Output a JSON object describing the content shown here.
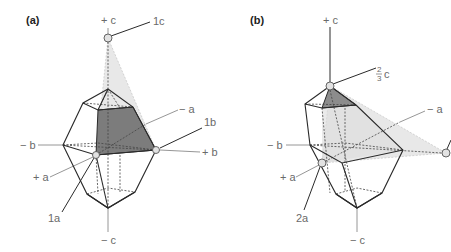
{
  "figure": {
    "panels": [
      {
        "id": "a",
        "label": "(a)",
        "axes": {
          "plus_c": "+ c",
          "minus_c": "− c",
          "plus_a": "+ a",
          "minus_a": "− a",
          "plus_b": "+ b",
          "minus_b": "− b"
        },
        "intercepts": {
          "a": "1a",
          "b": "1b",
          "c": "1c"
        },
        "plane_fill": "#e6e6e6",
        "face_fill": "#7a7a7a"
      },
      {
        "id": "b",
        "label": "(b)",
        "axes": {
          "plus_c": "+ c",
          "minus_c": "− c",
          "plus_a": "+ a",
          "minus_a": "− a",
          "minus_b": "− b"
        },
        "intercepts": {
          "a": "2a",
          "c_num": "2",
          "c_den": "3",
          "c_sym": "c"
        },
        "plane_fill": "#e6e6e6",
        "face_fill": "#8a8a8a"
      }
    ]
  }
}
